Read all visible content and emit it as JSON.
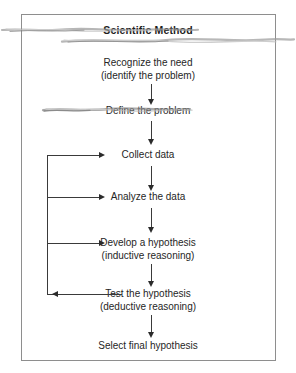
{
  "figure": {
    "title": "Scientific Method",
    "border_color": "#8e8e8e",
    "text_color": "#262626",
    "arrow_color": "#2b2b2b",
    "steps": [
      {
        "id": "recognize-the-need",
        "line1": "Recognize the need",
        "line2": "(identify the problem)"
      },
      {
        "id": "define-the-problem",
        "line1": "Define the problem",
        "line2": ""
      },
      {
        "id": "collect-data",
        "line1": "Collect data",
        "line2": ""
      },
      {
        "id": "analyze-the-data",
        "line1": "Analyze the data",
        "line2": ""
      },
      {
        "id": "develop-a-hypothesis",
        "line1": "Develop a hypothesis",
        "line2": "(inductive reasoning)"
      },
      {
        "id": "test-the-hypothesis",
        "line1": "Test the hypothesis",
        "line2": "(deductive reasoning)"
      },
      {
        "id": "select-final-hypothesis",
        "line1": "Select final hypothesis",
        "line2": ""
      }
    ]
  }
}
